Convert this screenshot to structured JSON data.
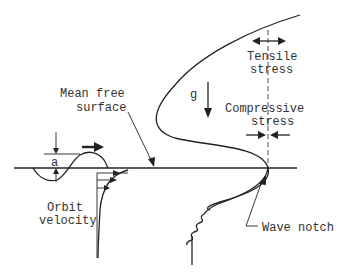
{
  "diagram": {
    "labels": {
      "mean_free_surface_line1": "Mean free",
      "mean_free_surface_line2": "surface",
      "gravity": "g",
      "tensile_line1": "Tensile",
      "tensile_line2": "stress",
      "compressive_line1": "Compressive",
      "compressive_line2": "stress",
      "amplitude": "a",
      "orbit_line1": "Orbit",
      "orbit_line2": "velocity",
      "wave_notch": "Wave notch"
    },
    "colors": {
      "line": "#222222",
      "text": "#333333",
      "background": "#ffffff"
    }
  }
}
